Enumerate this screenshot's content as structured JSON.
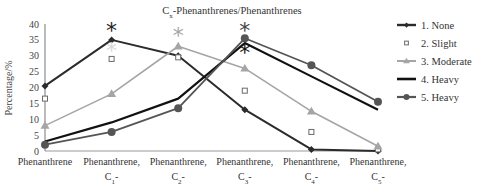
{
  "chart_data": {
    "type": "line",
    "title": "Cx-Phenanthrenes/Phenanthrenes",
    "title_main": "C",
    "title_sub": "x",
    "title_rest": "-Phenanthrenes/Phenanthrenes",
    "xlabel": "",
    "ylabel": "Percentage/%",
    "ylim": [
      0,
      40
    ],
    "yticks": [
      0,
      5,
      10,
      15,
      20,
      25,
      30,
      35,
      40
    ],
    "grid": false,
    "legend_position": "right",
    "categories": [
      {
        "line1": "Phenanthrene",
        "line2": ""
      },
      {
        "line1": "Phenanthrene,",
        "line2": "C",
        "sub": "1",
        "suffix": "-"
      },
      {
        "line1": "Phenanthrene,",
        "line2": "C",
        "sub": "2",
        "suffix": "-"
      },
      {
        "line1": "Phenanthrene,",
        "line2": "C",
        "sub": "3",
        "suffix": "-"
      },
      {
        "line1": "Phenanthrene,",
        "line2": "C",
        "sub": "4",
        "suffix": "-"
      },
      {
        "line1": "Phenanthrene,",
        "line2": "C",
        "sub": "5",
        "suffix": "-"
      }
    ],
    "series": [
      {
        "name": "1. None",
        "marker": "diamond",
        "color": "#2b2b2b",
        "line": true,
        "width": 2,
        "values": [
          20.5,
          35,
          30,
          13,
          0.5,
          0
        ]
      },
      {
        "name": "2. Slight",
        "marker": "open-square",
        "color": "#6a6a6a",
        "line": false,
        "width": 1,
        "values": [
          16.5,
          29,
          29.5,
          19,
          6,
          0.5
        ]
      },
      {
        "name": "3. Moderate",
        "marker": "triangle",
        "color": "#a5a5a5",
        "line": true,
        "width": 1.6,
        "values": [
          8,
          18,
          33,
          26,
          12.5,
          1.5
        ]
      },
      {
        "name": "4. Heavy",
        "marker": "none",
        "color": "#111111",
        "line": true,
        "width": 2.2,
        "values": [
          3,
          9,
          16.5,
          34,
          23.5,
          13
        ]
      },
      {
        "name": "5. Heavy",
        "marker": "circle",
        "color": "#555555",
        "line": true,
        "width": 1.8,
        "values": [
          2,
          6,
          13.5,
          35.5,
          27,
          15.5
        ]
      }
    ],
    "annotations": [
      {
        "symbol": "*",
        "category_index": 1,
        "y": 38.5,
        "color": "#222222"
      },
      {
        "symbol": "*",
        "category_index": 1,
        "y": 32,
        "color": "#d8d8d8"
      },
      {
        "symbol": "*",
        "category_index": 2,
        "y": 37,
        "color": "#a5a5a5"
      },
      {
        "symbol": "*",
        "category_index": 3,
        "y": 38.5,
        "color": "#444444"
      },
      {
        "symbol": "*",
        "category_index": 3,
        "y": 31.5,
        "color": "#111111"
      }
    ]
  }
}
